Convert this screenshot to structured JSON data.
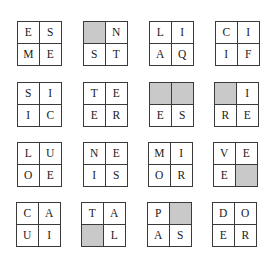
{
  "puzzle": {
    "shade_color": "#c9c9c9",
    "border_color": "#3a3a3a",
    "boxes": [
      {
        "cells": [
          "E",
          "S",
          "M",
          "E"
        ]
      },
      {
        "cells": [
          "",
          "N",
          "S",
          "T"
        ],
        "shaded": [
          0
        ]
      },
      {
        "cells": [
          "L",
          "I",
          "A",
          "Q"
        ]
      },
      {
        "cells": [
          "C",
          "I",
          "I",
          "F"
        ]
      },
      {
        "cells": [
          "S",
          "I",
          "I",
          "C"
        ]
      },
      {
        "cells": [
          "T",
          "E",
          "E",
          "R"
        ]
      },
      {
        "cells": [
          "",
          "",
          "E",
          "S"
        ],
        "shaded": [
          0,
          1
        ]
      },
      {
        "cells": [
          "",
          "I",
          "R",
          "E"
        ],
        "shaded": [
          0
        ]
      },
      {
        "cells": [
          "L",
          "U",
          "O",
          "E"
        ]
      },
      {
        "cells": [
          "N",
          "E",
          "I",
          "S"
        ]
      },
      {
        "cells": [
          "M",
          "I",
          "O",
          "R"
        ]
      },
      {
        "cells": [
          "V",
          "E",
          "E",
          ""
        ],
        "shaded": [
          3
        ]
      },
      {
        "cells": [
          "C",
          "A",
          "U",
          "I"
        ]
      },
      {
        "cells": [
          "T",
          "A",
          "",
          "L"
        ],
        "shaded": [
          2
        ]
      },
      {
        "cells": [
          "P",
          "",
          "A",
          "S"
        ],
        "shaded": [
          1
        ]
      },
      {
        "cells": [
          "D",
          "O",
          "E",
          "R"
        ]
      }
    ]
  }
}
